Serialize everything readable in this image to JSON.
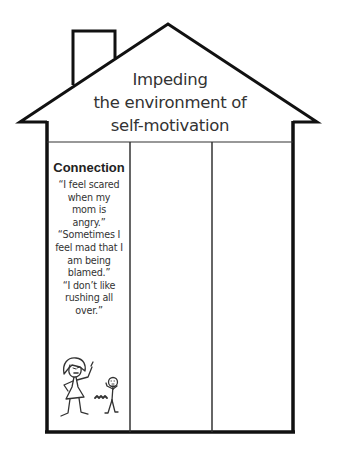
{
  "house": {
    "roof_title_lines": [
      "Impeding",
      "the environment of",
      "self-motivation"
    ],
    "columns": [
      {
        "heading": "Connection",
        "quotes": [
          [
            "“I feel scared",
            "when my",
            "mom is",
            "angry.”"
          ],
          [
            "“Sometimes I",
            "feel mad that I",
            "am being",
            "blamed.”"
          ],
          [
            "“I don’t like",
            "rushing all",
            "over.”"
          ]
        ],
        "illustration": "angry-mother-and-child-stick-figures"
      },
      {
        "heading": "",
        "quotes": []
      },
      {
        "heading": "",
        "quotes": []
      }
    ]
  }
}
